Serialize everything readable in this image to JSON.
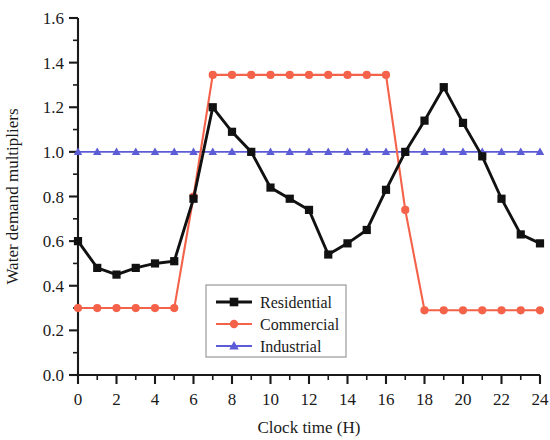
{
  "chart_data": {
    "type": "line",
    "title": "",
    "xlabel": "Clock time (H)",
    "ylabel": "Water demand multipliers",
    "xlim": [
      0,
      24
    ],
    "ylim": [
      0.0,
      1.6
    ],
    "grid": false,
    "legend_position": "inside-lower-center",
    "x": [
      0,
      1,
      2,
      3,
      4,
      5,
      6,
      7,
      8,
      9,
      10,
      11,
      12,
      13,
      14,
      15,
      16,
      17,
      18,
      19,
      20,
      21,
      22,
      23,
      24
    ],
    "xticks": [
      0,
      2,
      4,
      6,
      8,
      10,
      12,
      14,
      16,
      18,
      20,
      22,
      24
    ],
    "xtick_labels": [
      "0",
      "2",
      "4",
      "6",
      "8",
      "10",
      "12",
      "14",
      "16",
      "18",
      "20",
      "22",
      "24"
    ],
    "x_minor_ticks": [
      1,
      3,
      5,
      7,
      9,
      11,
      13,
      15,
      17,
      19,
      21,
      23
    ],
    "yticks": [
      0.0,
      0.2,
      0.4,
      0.6,
      0.8,
      1.0,
      1.2,
      1.4,
      1.6
    ],
    "ytick_labels": [
      "0.0",
      "0.2",
      "0.4",
      "0.6",
      "0.8",
      "1.0",
      "1.2",
      "1.4",
      "1.6"
    ],
    "y_minor_ticks": [
      0.1,
      0.3,
      0.5,
      0.7,
      0.9,
      1.1,
      1.3,
      1.5
    ],
    "series": [
      {
        "name": "Residential",
        "color": "#111111",
        "marker": "square",
        "values": [
          0.6,
          0.48,
          0.45,
          0.48,
          0.5,
          0.51,
          0.79,
          1.2,
          1.09,
          1.0,
          0.84,
          0.79,
          0.74,
          0.54,
          0.59,
          0.65,
          0.83,
          1.0,
          1.14,
          1.29,
          1.13,
          0.98,
          0.79,
          0.63,
          0.59
        ]
      },
      {
        "name": "Commercial",
        "color": "#F4624A",
        "marker": "circle",
        "values": [
          0.3,
          0.3,
          0.3,
          0.3,
          0.3,
          0.3,
          0.8,
          1.345,
          1.345,
          1.345,
          1.345,
          1.345,
          1.345,
          1.345,
          1.345,
          1.345,
          1.345,
          0.74,
          0.29,
          0.29,
          0.29,
          0.29,
          0.29,
          0.29,
          0.29
        ]
      },
      {
        "name": "Industrial",
        "color": "#5C5CD6",
        "marker": "triangle",
        "values": [
          1.0,
          1.0,
          1.0,
          1.0,
          1.0,
          1.0,
          1.0,
          1.0,
          1.0,
          1.0,
          1.0,
          1.0,
          1.0,
          1.0,
          1.0,
          1.0,
          1.0,
          1.0,
          1.0,
          1.0,
          1.0,
          1.0,
          1.0,
          1.0,
          1.0
        ]
      }
    ]
  }
}
